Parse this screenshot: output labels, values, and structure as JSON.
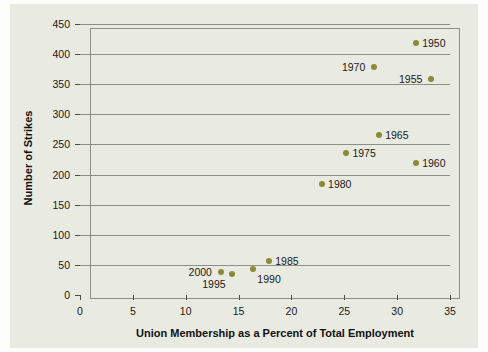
{
  "chart_data": {
    "type": "scatter",
    "title": "",
    "xlabel": "Union Membership as a Percent of Total Employment",
    "ylabel": "Number of Strikes",
    "xlim": [
      0,
      35
    ],
    "ylim": [
      0,
      450
    ],
    "xticks": [
      "0",
      "5",
      "10",
      "15",
      "20",
      "25",
      "30",
      "35"
    ],
    "yticks": [
      "0",
      "50",
      "100",
      "150",
      "200",
      "250",
      "300",
      "350",
      "400",
      "450"
    ],
    "grid": "horizontal",
    "legend": "none",
    "marker_color": "#8b8b33",
    "points": [
      {
        "label": "1950",
        "x": 31.8,
        "y": 419,
        "label_side": "right"
      },
      {
        "label": "1955",
        "x": 33.2,
        "y": 359,
        "label_side": "left"
      },
      {
        "label": "1960",
        "x": 31.8,
        "y": 219,
        "label_side": "right"
      },
      {
        "label": "1965",
        "x": 28.3,
        "y": 265,
        "label_side": "right"
      },
      {
        "label": "1970",
        "x": 27.8,
        "y": 378,
        "label_side": "left"
      },
      {
        "label": "1975",
        "x": 25.2,
        "y": 236,
        "label_side": "right"
      },
      {
        "label": "1980",
        "x": 22.9,
        "y": 185,
        "label_side": "right"
      },
      {
        "label": "1985",
        "x": 17.9,
        "y": 57,
        "label_side": "right"
      },
      {
        "label": "1990",
        "x": 16.4,
        "y": 44,
        "label_side": "below-right"
      },
      {
        "label": "1995",
        "x": 14.4,
        "y": 35,
        "label_side": "below-left"
      },
      {
        "label": "2000",
        "x": 13.3,
        "y": 39,
        "label_side": "left"
      }
    ]
  },
  "colors": {
    "panel_background": "#e9eae1",
    "figure_background": "#fdfdfb",
    "axis": "#8d8f86",
    "marker": "#8b8b33",
    "text": "#1a1a1a"
  }
}
